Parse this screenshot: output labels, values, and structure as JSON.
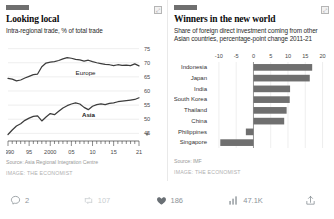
{
  "post": {
    "media": [
      {
        "tag_color": "#6f6f6f",
        "title": "Looking local",
        "subtitle": "Intra-regional trade, % of total trade",
        "source": "Source: Asia Regional Integration Centre",
        "credit": "IMAGE: THE ECONOMIST",
        "expand_badge": "⤢"
      },
      {
        "tag_color": "#6f6f6f",
        "title": "Winners in the new world",
        "subtitle": "Share of foreign direct investment coming from other Asian countries, percentage-point change 2011-21",
        "source": "Source: IMF",
        "credit": "IMAGE: THE ECONOMIST",
        "expand_badge": "⤢"
      }
    ],
    "actions": [
      {
        "name": "reply",
        "icon": "comment-icon",
        "count": "2"
      },
      {
        "name": "repost",
        "icon": "retweet-icon",
        "count": "107"
      },
      {
        "name": "like",
        "icon": "heart-icon",
        "count": "186"
      },
      {
        "name": "views",
        "icon": "analytics-icon",
        "count": "47.1K"
      },
      {
        "name": "share",
        "icon": "share-icon",
        "count": ""
      }
    ]
  },
  "chart_data": [
    {
      "type": "line",
      "title": "Looking local",
      "subtitle": "Intra-regional trade, % of total trade",
      "xlabel": "",
      "ylabel": "% of total trade",
      "xlim": [
        1990,
        2021
      ],
      "ylim": [
        43,
        77
      ],
      "yticks": [
        45,
        50,
        55,
        60,
        65,
        70,
        75
      ],
      "xticks": [
        1990,
        1995,
        2000,
        2005,
        2010,
        2015,
        2021
      ],
      "xticklabels": [
        "1990",
        "95",
        "2000",
        "05",
        "10",
        "15",
        "21"
      ],
      "grid": true,
      "legend_position": "inline-labels",
      "source": "Source: Asia Regional Integration Centre",
      "series": [
        {
          "name": "Europe",
          "label_bold": false,
          "x": [
            1990,
            1991,
            1992,
            1993,
            1994,
            1995,
            1996,
            1997,
            1998,
            1999,
            2000,
            2001,
            2002,
            2003,
            2004,
            2005,
            2006,
            2007,
            2008,
            2009,
            2010,
            2011,
            2012,
            2013,
            2014,
            2015,
            2016,
            2017,
            2018,
            2019,
            2020,
            2021
          ],
          "values": [
            64.5,
            64.2,
            63.6,
            63.9,
            64.6,
            65.2,
            65.8,
            66.0,
            68.6,
            69.9,
            70.2,
            70.4,
            70.8,
            71.4,
            71.8,
            71.6,
            71.2,
            71.0,
            70.6,
            70.9,
            70.4,
            70.0,
            69.7,
            69.4,
            69.3,
            69.0,
            69.3,
            69.1,
            69.2,
            69.0,
            69.6,
            68.9
          ]
        },
        {
          "name": "Asia",
          "label_bold": true,
          "x": [
            1990,
            1991,
            1992,
            1993,
            1994,
            1995,
            1996,
            1997,
            1998,
            1999,
            2000,
            2001,
            2002,
            2003,
            2004,
            2005,
            2006,
            2007,
            2008,
            2009,
            2010,
            2011,
            2012,
            2013,
            2014,
            2015,
            2016,
            2017,
            2018,
            2019,
            2020,
            2021
          ],
          "values": [
            44.6,
            46.2,
            47.6,
            48.4,
            49.6,
            50.4,
            51.0,
            51.2,
            49.4,
            50.8,
            52.0,
            51.6,
            52.8,
            54.0,
            54.8,
            55.4,
            55.8,
            55.4,
            54.2,
            53.4,
            54.6,
            55.2,
            55.4,
            55.2,
            55.6,
            55.8,
            56.2,
            56.4,
            56.6,
            56.8,
            57.0,
            57.6
          ]
        }
      ]
    },
    {
      "type": "bar",
      "orientation": "horizontal",
      "title": "Winners in the new world",
      "subtitle": "Share of foreign direct investment coming from other Asian countries, percentage-point change 2011-21",
      "xlabel": "percentage-point change",
      "ylabel": "",
      "xlim": [
        -12,
        21
      ],
      "xticks": [
        -10,
        -5,
        0,
        5,
        10,
        15,
        20
      ],
      "xticklabels": [
        "-10",
        "-5",
        "0",
        "5",
        "10",
        "15",
        "20"
      ],
      "grid": true,
      "bar_color": "#6f6f6f",
      "source": "Source: IMF",
      "categories": [
        "Indonesia",
        "Japan",
        "India",
        "South Korea",
        "Thailand",
        "China",
        "Philippines",
        "Singapore"
      ],
      "values": [
        17.0,
        16.3,
        10.6,
        10.5,
        9.6,
        8.9,
        -2.2,
        -9.6
      ]
    }
  ]
}
